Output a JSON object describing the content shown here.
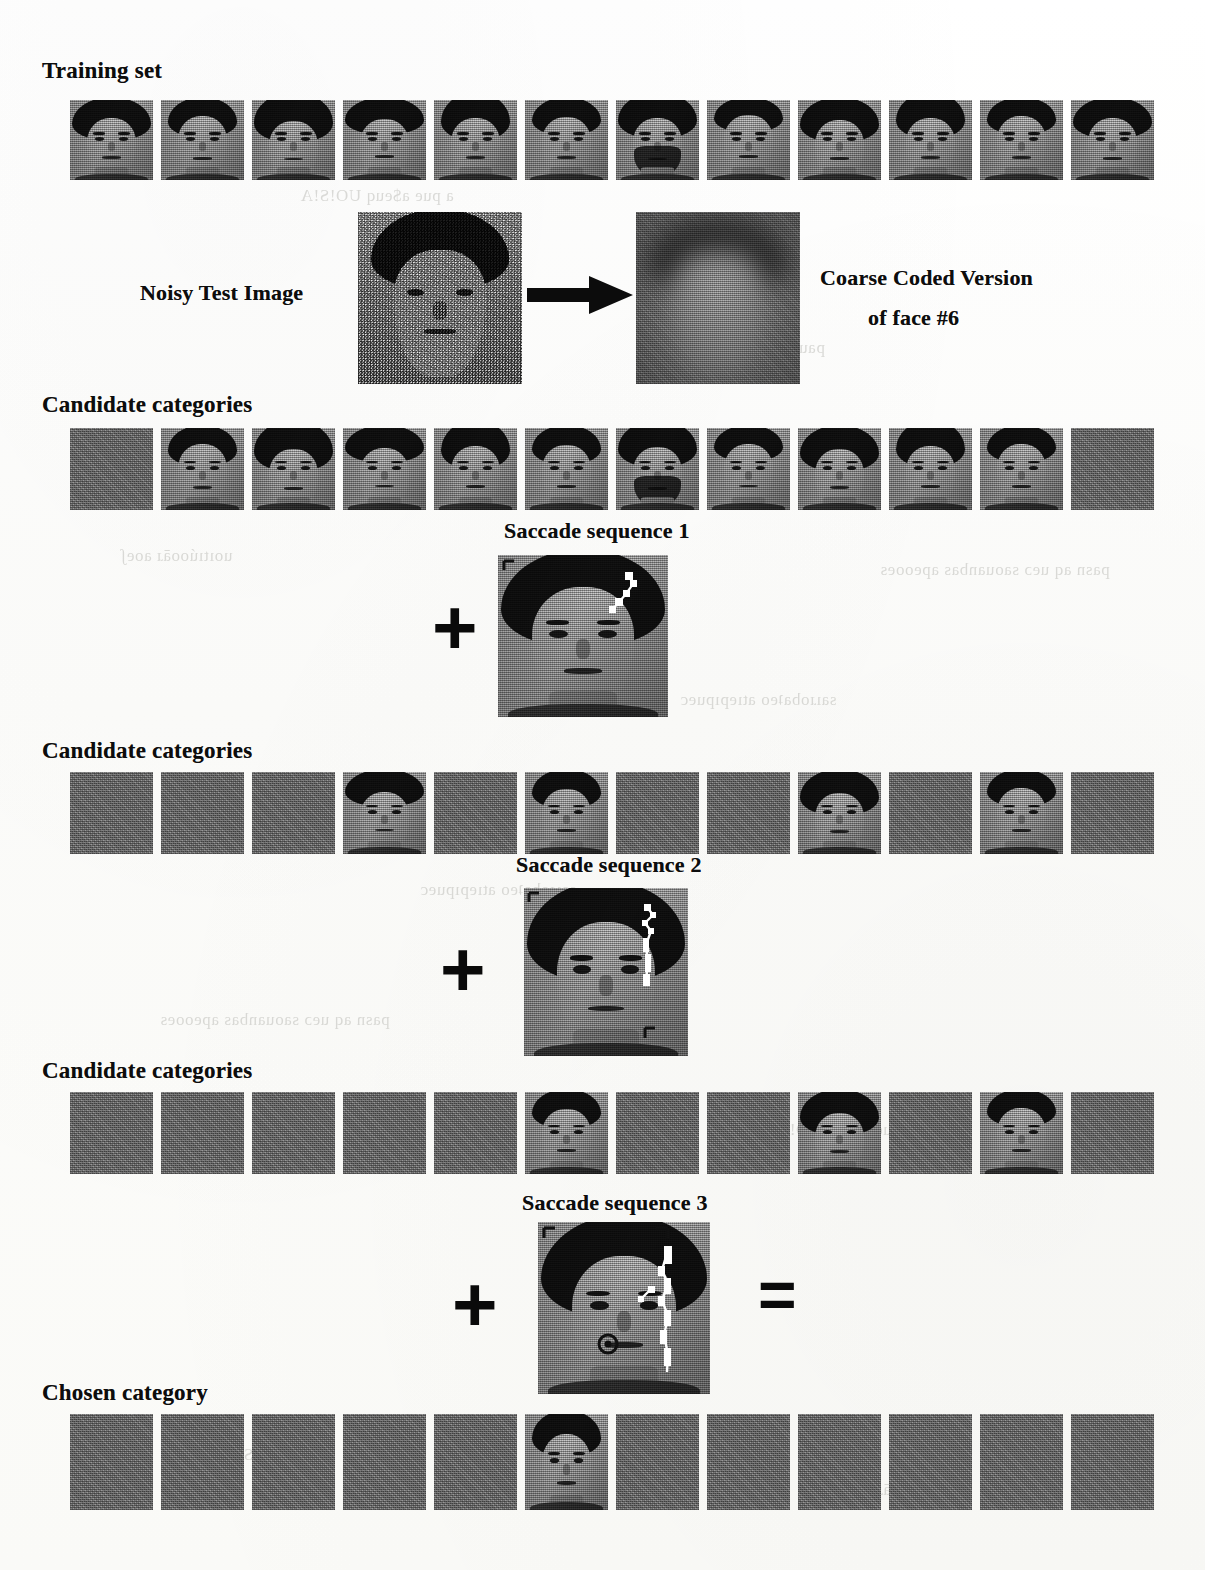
{
  "figure": {
    "labels": {
      "training_set": "Training set",
      "noisy_test_image": "Noisy Test Image",
      "coarse_coded_line1": "Coarse Coded Version",
      "coarse_coded_line2": "of face #6",
      "candidate_categories_1": "Candidate categories",
      "candidate_categories_2": "Candidate categories",
      "candidate_categories_3": "Candidate categories",
      "saccade_sequence_1": "Saccade sequence 1",
      "saccade_sequence_2": "Saccade sequence 2",
      "saccade_sequence_3": "Saccade sequence 3",
      "chosen_category": "Chosen category"
    },
    "operators": {
      "plus": "+",
      "equals": "="
    },
    "colors": {
      "paper": "#fdfdfb",
      "ink": "#0d0d0d",
      "raster_gray": "#8a8a8a",
      "blank_cell_gray": "#7d7d7d",
      "hair_black": "#141414",
      "skin_gray": "#b9b9b9",
      "bleed_text": "#b9b9b4"
    },
    "grid": {
      "columns": 12,
      "cell_width": 83,
      "cell_height": 80,
      "pitch": 91,
      "left": 70
    },
    "rows": [
      {
        "id": "training-set",
        "label_key": "training_set",
        "present": [
          true,
          true,
          true,
          true,
          true,
          true,
          true,
          true,
          true,
          true,
          true,
          true
        ]
      },
      {
        "id": "candidate-categories-1",
        "label_key": "candidate_categories_1",
        "present": [
          false,
          true,
          true,
          true,
          true,
          true,
          true,
          true,
          true,
          true,
          true,
          false
        ]
      },
      {
        "id": "candidate-categories-2",
        "label_key": "candidate_categories_2",
        "present": [
          false,
          false,
          false,
          true,
          false,
          true,
          false,
          false,
          true,
          false,
          true,
          false
        ]
      },
      {
        "id": "candidate-categories-3",
        "label_key": "candidate_categories_3",
        "present": [
          false,
          false,
          false,
          false,
          false,
          true,
          false,
          false,
          true,
          false,
          true,
          false
        ]
      },
      {
        "id": "chosen-category",
        "label_key": "chosen_category",
        "present": [
          false,
          false,
          false,
          false,
          false,
          true,
          false,
          false,
          false,
          false,
          false,
          false
        ]
      }
    ],
    "face_variants": [
      "round-bowl",
      "dark-bob",
      "parted-long",
      "flat-fringe",
      "dark-full",
      "short-crop",
      "bearded",
      "oval-light",
      "side-part",
      "high-hair",
      "wide-hair",
      "narrow-hair"
    ],
    "chosen_face_index": 6,
    "bleed_through_text": [
      "a pue a$euq UO!S!A",
      "paumı pue Suoıssı",
      "uoıtıúooāɹ aoeʃ",
      "saıɹobaʇeo atıepıpuec",
      "pasn aq ueɔ saouanbas apeooes"
    ]
  }
}
